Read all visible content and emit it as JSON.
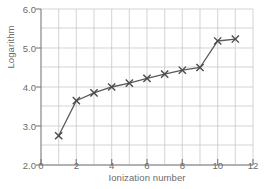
{
  "chart_data": {
    "type": "line",
    "title": "",
    "xlabel": "Ionization number",
    "ylabel": "Logarithm",
    "xlim": [
      0,
      12
    ],
    "ylim": [
      2.0,
      6.0
    ],
    "grid": true,
    "legend": "none",
    "marker": "x",
    "line_color": "#5a5a5a",
    "grid_color": "#b8b8b8",
    "axis_color": "#7a7a7a",
    "text_color": "#6b6b6b",
    "xticks": [
      0,
      2,
      4,
      6,
      8,
      10,
      12
    ],
    "xtick_labels": [
      "0",
      "2",
      "4",
      "6",
      "8",
      "10",
      "12"
    ],
    "yticks": [
      2.0,
      3.0,
      4.0,
      5.0,
      6.0
    ],
    "ytick_labels": [
      "2.0",
      "3.0",
      "4.0",
      "5.0",
      "6.0"
    ],
    "x_minor_step": 1,
    "y_minor_step": 0.5,
    "x": [
      1,
      2,
      3,
      4,
      5,
      6,
      7,
      8,
      9,
      10,
      11
    ],
    "values": [
      2.75,
      3.65,
      3.85,
      4.0,
      4.1,
      4.22,
      4.33,
      4.43,
      4.5,
      5.18,
      5.23
    ]
  }
}
